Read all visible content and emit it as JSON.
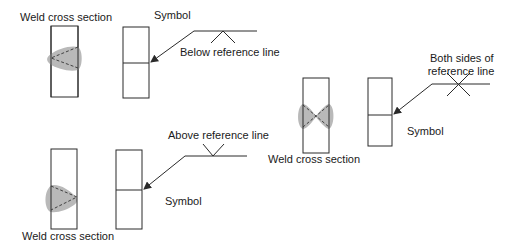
{
  "diagram": {
    "colors": {
      "line": "#2a2a2a",
      "weld_fill": "#b9b9b9",
      "background": "#ffffff"
    },
    "groups": [
      {
        "id": "below",
        "weld_label": "Weld cross section",
        "symbol_label": "Symbol",
        "reference_label": "Below reference line",
        "weld_symbol": "fillet-below"
      },
      {
        "id": "both",
        "weld_label": "Weld cross section",
        "symbol_label": "Symbol",
        "reference_label_line1": "Both sides of",
        "reference_label_line2": "reference line",
        "weld_symbol": "fillet-both"
      },
      {
        "id": "above",
        "weld_label": "Weld cross section",
        "symbol_label": "Symbol",
        "reference_label": "Above reference line",
        "weld_symbol": "fillet-above"
      }
    ]
  }
}
